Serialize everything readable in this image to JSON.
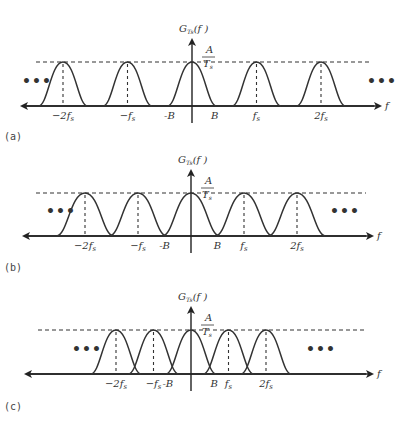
{
  "figure": {
    "y_axis_label": "G_Ts(f)",
    "y_axis_label_main": "G",
    "y_axis_label_sub": "Ts",
    "y_axis_label_arg": "(f )",
    "x_axis_label": "f",
    "peak_label_num": "A",
    "peak_label_den": "T",
    "peak_label_den_sub": "s",
    "ellipsis": "•••",
    "panels": [
      {
        "caption": "(a)",
        "description": "Sampling rate well above Nyquist: spectral replicas separated by gaps",
        "replica_centers_in_fs": [
          -2,
          -1,
          0,
          1,
          2
        ],
        "bandwidth_B_over_fs": 0.35,
        "tick_labels": [
          "−2f",
          "−f",
          "-B",
          "B",
          "f",
          "2f"
        ],
        "tick_keys": [
          "-2fs",
          "-fs",
          "-B",
          "B",
          "fs",
          "2fs"
        ]
      },
      {
        "caption": "(b)",
        "description": "Sampling at Nyquist rate: replicas just touch",
        "replica_centers_in_fs": [
          -2,
          -1,
          0,
          1,
          2
        ],
        "bandwidth_B_over_fs": 0.5,
        "tick_labels": [
          "−2f",
          "−f",
          "-B",
          "B",
          "f",
          "2f"
        ],
        "tick_keys": [
          "-2fs",
          "-fs",
          "-B",
          "B",
          "fs",
          "2fs"
        ]
      },
      {
        "caption": "(c)",
        "description": "Undersampling: replicas overlap (aliasing)",
        "replica_centers_in_fs": [
          -2,
          -1,
          0,
          1,
          2
        ],
        "bandwidth_B_over_fs": 0.62,
        "tick_labels": [
          "−2f",
          "−f",
          "-B",
          "B",
          "f",
          "2f"
        ],
        "tick_keys": [
          "-2fs",
          "-fs",
          "-B",
          "B",
          "fs",
          "2fs"
        ]
      }
    ]
  }
}
